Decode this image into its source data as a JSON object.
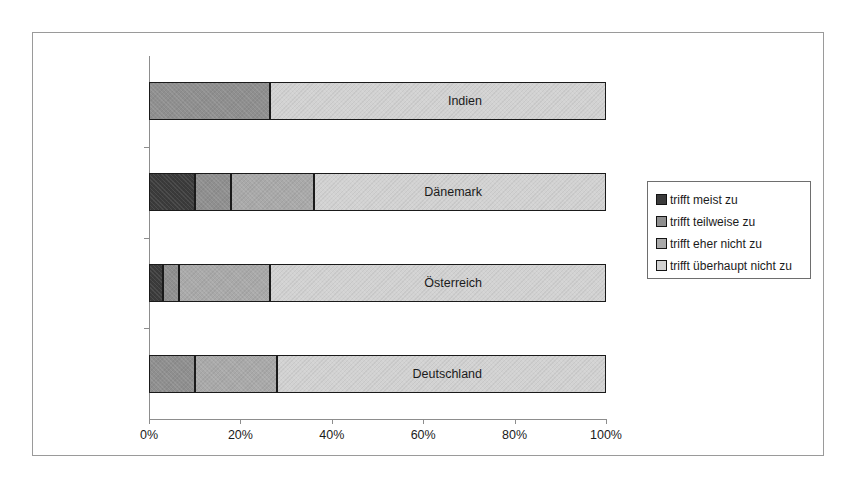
{
  "chart_data": {
    "type": "bar",
    "orientation": "horizontal",
    "stacked": true,
    "normalized": "100%",
    "title": "",
    "subtitle": "",
    "xlabel": "",
    "ylabel": "",
    "xlim": [
      0,
      100
    ],
    "xticks": [
      0,
      20,
      40,
      60,
      80,
      100
    ],
    "xticklabels": [
      "0%",
      "20%",
      "40%",
      "60%",
      "80%",
      "100%"
    ],
    "grid": false,
    "legend_position": "right",
    "categories": [
      "Indien",
      "Dänemark",
      "Österreich",
      "Deutschland"
    ],
    "series": [
      {
        "name": "trifft meist zu",
        "color": "#3b3b3b",
        "values": [
          0,
          10,
          3,
          0
        ]
      },
      {
        "name": "trifft teilweise zu",
        "color": "#8f8f8f",
        "values": [
          26.5,
          8,
          3.5,
          10
        ]
      },
      {
        "name": "trifft eher nicht zu",
        "color": "#a9a9a9",
        "values": [
          0,
          18,
          20,
          18
        ]
      },
      {
        "name": "trifft überhaupt nicht zu",
        "color": "#d2d2d2",
        "values": [
          73.5,
          64,
          73.5,
          72
        ]
      }
    ]
  },
  "legend": {
    "items": [
      {
        "label": "trifft meist zu"
      },
      {
        "label": "trifft teilweise zu"
      },
      {
        "label": "trifft eher nicht zu"
      },
      {
        "label": "trifft überhaupt nicht zu"
      }
    ]
  }
}
